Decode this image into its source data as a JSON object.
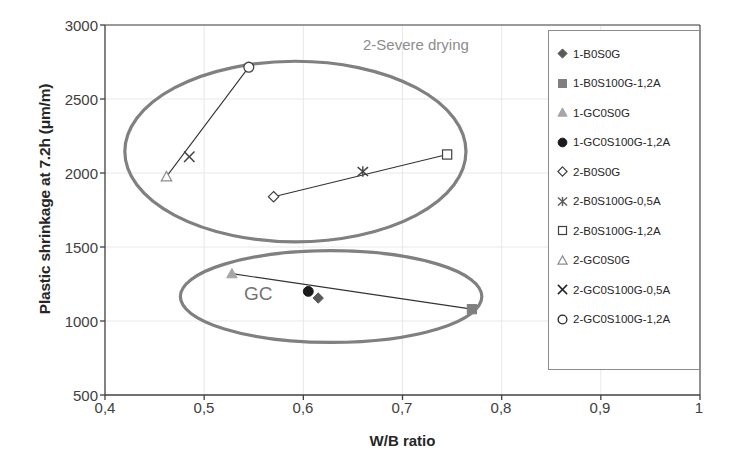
{
  "chart_data": {
    "type": "scatter",
    "title": "",
    "xlabel": "W/B ratio",
    "ylabel": "Plastic shrinkage at 7.2h  (μm/m)",
    "xlim": [
      0.4,
      1.0
    ],
    "ylim": [
      500,
      3000
    ],
    "xticks": [
      "0,4",
      "0,5",
      "0,6",
      "0,7",
      "0,8",
      "0,9",
      "1"
    ],
    "xtick_values": [
      0.4,
      0.5,
      0.6,
      0.7,
      0.8,
      0.9,
      1.0
    ],
    "yticks": [
      "500",
      "1000",
      "1500",
      "2000",
      "2500",
      "3000"
    ],
    "ytick_values": [
      500,
      1000,
      1500,
      2000,
      2500,
      3000
    ],
    "grid": true,
    "legend_position": "right",
    "series": [
      {
        "name": "1-B0S0G",
        "marker": "filled-diamond",
        "color": "#595959",
        "points": [
          {
            "x": 0.615,
            "y": 1155
          }
        ]
      },
      {
        "name": "1-B0S100G-1,2A",
        "marker": "filled-square",
        "color": "#7f7f7f",
        "points": [
          {
            "x": 0.77,
            "y": 1080
          }
        ]
      },
      {
        "name": "1-GC0S0G",
        "marker": "filled-triangle",
        "color": "#a6a6a6",
        "points": [
          {
            "x": 0.528,
            "y": 1320
          }
        ]
      },
      {
        "name": "1-GC0S100G-1,2A",
        "marker": "filled-circle",
        "color": "#1a1a1a",
        "points": [
          {
            "x": 0.605,
            "y": 1200
          }
        ]
      },
      {
        "name": "2-B0S0G",
        "marker": "open-diamond",
        "color": "#404040",
        "points": [
          {
            "x": 0.57,
            "y": 1840
          }
        ]
      },
      {
        "name": "2-B0S100G-0,5A",
        "marker": "asterisk",
        "color": "#404040",
        "points": [
          {
            "x": 0.66,
            "y": 2010
          }
        ]
      },
      {
        "name": "2-B0S100G-1,2A",
        "marker": "open-square",
        "color": "#404040",
        "points": [
          {
            "x": 0.745,
            "y": 2125
          }
        ]
      },
      {
        "name": "2-GC0S0G",
        "marker": "open-triangle",
        "color": "#8c8c8c",
        "points": [
          {
            "x": 0.462,
            "y": 1975
          }
        ]
      },
      {
        "name": "2-GC0S100G-0,5A",
        "marker": "cross-x",
        "color": "#404040",
        "points": [
          {
            "x": 0.485,
            "y": 2110
          }
        ]
      },
      {
        "name": "2-GC0S100G-1,2A",
        "marker": "open-circle",
        "color": "#404040",
        "points": [
          {
            "x": 0.545,
            "y": 2715
          }
        ]
      }
    ],
    "connector_lines": [
      {
        "name": "upper-left-trend",
        "from": {
          "x": 0.462,
          "y": 1975
        },
        "to": {
          "x": 0.545,
          "y": 2715
        }
      },
      {
        "name": "upper-right-trend",
        "from": {
          "x": 0.57,
          "y": 1840
        },
        "to": {
          "x": 0.745,
          "y": 2125
        }
      },
      {
        "name": "lower-trend",
        "from": {
          "x": 0.528,
          "y": 1320
        },
        "to": {
          "x": 0.77,
          "y": 1080
        }
      }
    ],
    "annotations": [
      {
        "name": "severe-drying-label",
        "text": "2-Severe drying",
        "x": 0.665,
        "y": 2870
      },
      {
        "name": "gc-label",
        "text": "GC",
        "x": 0.548,
        "y": 1130
      }
    ],
    "ellipses": [
      {
        "name": "severe-drying-ellipse",
        "cx": 0.592,
        "cy": 2145,
        "rx": 0.172,
        "ry": 610,
        "color": "#808080"
      },
      {
        "name": "gc-ellipse",
        "cx": 0.628,
        "cy": 1165,
        "rx": 0.152,
        "ry": 310,
        "color": "#808080"
      }
    ]
  },
  "axes": {
    "x_title": "W/B ratio",
    "y_title": "Plastic shrinkage at 7.2h  (μm/m)",
    "x_tick_labels": [
      "0,4",
      "0,5",
      "0,6",
      "0,7",
      "0,8",
      "0,9",
      "1"
    ],
    "y_tick_labels": [
      "3000",
      "2500",
      "2000",
      "1500",
      "1000",
      "500"
    ]
  },
  "legend": {
    "items": [
      {
        "label": "1-B0S0G",
        "marker": "filled-diamond",
        "color": "#595959"
      },
      {
        "label": "1-B0S100G-1,2A",
        "marker": "filled-square",
        "color": "#7f7f7f"
      },
      {
        "label": "1-GC0S0G",
        "marker": "filled-triangle",
        "color": "#a6a6a6"
      },
      {
        "label": "1-GC0S100G-1,2A",
        "marker": "filled-circle",
        "color": "#1a1a1a"
      },
      {
        "label": "2-B0S0G",
        "marker": "open-diamond",
        "color": "#404040"
      },
      {
        "label": "2-B0S100G-0,5A",
        "marker": "asterisk",
        "color": "#595959"
      },
      {
        "label": "2-B0S100G-1,2A",
        "marker": "open-square",
        "color": "#404040"
      },
      {
        "label": "2-GC0S0G",
        "marker": "open-triangle",
        "color": "#8c8c8c"
      },
      {
        "label": "2-GC0S100G-0,5A",
        "marker": "cross-x",
        "color": "#262626"
      },
      {
        "label": "2-GC0S100G-1,2A",
        "marker": "open-circle",
        "color": "#262626"
      }
    ]
  },
  "annotations": {
    "severe_drying": "2-Severe drying",
    "gc": "GC"
  },
  "colors": {
    "axis": "#404040",
    "grid": "#e8e8e8",
    "ellipse": "#808080",
    "annotation": "#8c8c8c",
    "text": "#262626"
  }
}
